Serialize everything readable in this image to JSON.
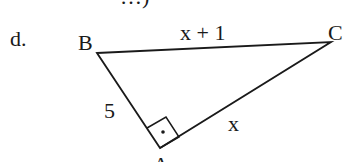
{
  "top_text_fragment": "…)",
  "problem_label": "d.",
  "vertices": {
    "A": {
      "label": "A",
      "x": 160,
      "y": 148
    },
    "B": {
      "label": "B",
      "x": 97,
      "y": 53
    },
    "C": {
      "label": "C",
      "x": 331,
      "y": 42
    }
  },
  "sides": {
    "BC": "x + 1",
    "AB": "5",
    "AC": "x"
  },
  "right_angle_at": "A",
  "colors": {
    "ink": "#1a1a1a",
    "background": "#ffffff"
  }
}
